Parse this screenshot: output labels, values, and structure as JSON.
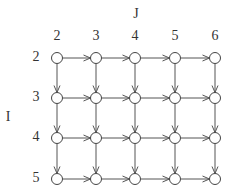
{
  "diagram": {
    "column_axis_label": "J",
    "row_axis_label": "I",
    "columns": [
      "2",
      "3",
      "4",
      "5",
      "6"
    ],
    "rows": [
      "2",
      "3",
      "4",
      "5"
    ],
    "edge_color": "#555555",
    "node_stroke": "#444444",
    "node_fill": "#ffffff",
    "edges": "each node connects right to next column and down to next row"
  }
}
